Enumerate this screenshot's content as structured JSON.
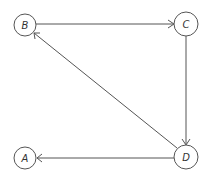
{
  "diagram": {
    "type": "directed-graph",
    "nodes": [
      {
        "id": "B",
        "label": "B",
        "x": 25,
        "y": 25,
        "r": 11
      },
      {
        "id": "C",
        "label": "C",
        "x": 186,
        "y": 24,
        "r": 12
      },
      {
        "id": "D",
        "label": "D",
        "x": 186,
        "y": 157,
        "r": 12
      },
      {
        "id": "A",
        "label": "A",
        "x": 25,
        "y": 158,
        "r": 11
      }
    ],
    "edges": [
      {
        "from": "B",
        "to": "C"
      },
      {
        "from": "C",
        "to": "D"
      },
      {
        "from": "D",
        "to": "B"
      },
      {
        "from": "D",
        "to": "A"
      }
    ],
    "colors": {
      "stroke": "#555555",
      "label": "#333333",
      "background": "#ffffff"
    }
  }
}
